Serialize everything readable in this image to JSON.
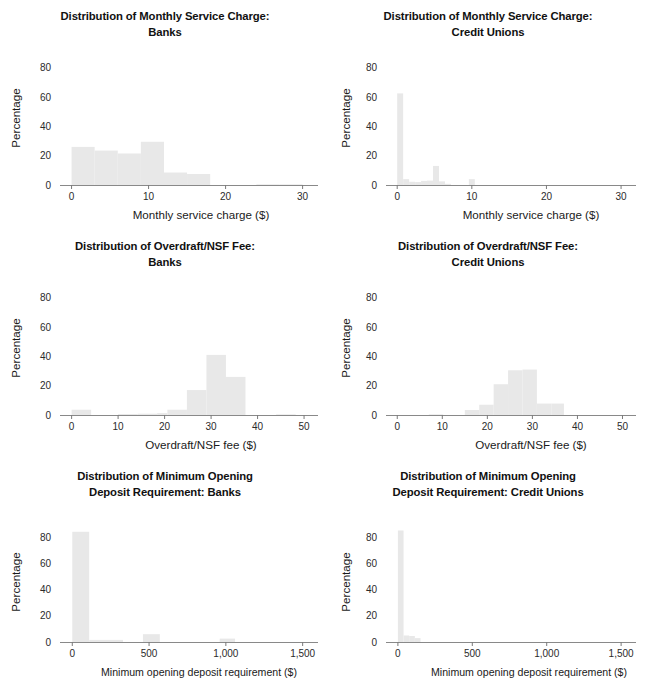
{
  "figure": {
    "kind": "small-multiples-histogram-grid",
    "rows": 3,
    "cols": 2,
    "bar_color": "#e8e8e8",
    "axis_color": "#5a5a5a",
    "text_color": "#1a1a1a"
  },
  "chart_data": [
    {
      "id": "monthly-service-charge-banks",
      "type": "bar",
      "title": "Distribution of Monthly Service Charge: Banks",
      "title_line1": "Distribution of Monthly Service Charge:",
      "title_line2": "Banks",
      "xlabel": "Monthly service charge ($)",
      "ylabel": "Percentage",
      "xlim": [
        -1.5,
        32
      ],
      "ylim": [
        0,
        88
      ],
      "xticks": [
        0,
        10,
        20,
        30
      ],
      "xtick_labels": [
        "0",
        "10",
        "20",
        "30"
      ],
      "yticks": [
        0,
        20,
        40,
        60,
        80
      ],
      "ytick_labels": [
        "0",
        "20",
        "40",
        "60",
        "80"
      ],
      "grid": false,
      "bin_width": 3,
      "bins": [
        {
          "x0": 0,
          "x1": 3,
          "value": 26
        },
        {
          "x0": 3,
          "x1": 6,
          "value": 23.5
        },
        {
          "x0": 6,
          "x1": 9,
          "value": 21.5
        },
        {
          "x0": 9,
          "x1": 12,
          "value": 29.5
        },
        {
          "x0": 12,
          "x1": 15,
          "value": 8.5
        },
        {
          "x0": 15,
          "x1": 18,
          "value": 7.5
        },
        {
          "x0": 24,
          "x1": 27,
          "value": 0.4
        },
        {
          "x0": 27,
          "x1": 30,
          "value": 0.4
        }
      ]
    },
    {
      "id": "monthly-service-charge-credit-unions",
      "type": "bar",
      "title": "Distribution of Monthly Service Charge: Credit Unions",
      "title_line1": "Distribution of Monthly Service Charge:",
      "title_line2": "Credit Unions",
      "xlabel": "Monthly service charge ($)",
      "ylabel": "Percentage",
      "xlim": [
        -1.5,
        32
      ],
      "ylim": [
        0,
        88
      ],
      "xticks": [
        0,
        10,
        20,
        30
      ],
      "xtick_labels": [
        "0",
        "10",
        "20",
        "30"
      ],
      "yticks": [
        0,
        20,
        40,
        60,
        80
      ],
      "ytick_labels": [
        "0",
        "20",
        "40",
        "60",
        "80"
      ],
      "grid": false,
      "bin_width": 0.8,
      "bins": [
        {
          "x0": 0,
          "x1": 0.8,
          "value": 62.5
        },
        {
          "x0": 0.8,
          "x1": 1.6,
          "value": 4.0
        },
        {
          "x0": 1.6,
          "x1": 2.4,
          "value": 2.2
        },
        {
          "x0": 2.4,
          "x1": 3.2,
          "value": 2.0
        },
        {
          "x0": 3.2,
          "x1": 4.0,
          "value": 2.8
        },
        {
          "x0": 4.0,
          "x1": 4.8,
          "value": 3.0
        },
        {
          "x0": 4.8,
          "x1": 5.6,
          "value": 13.0
        },
        {
          "x0": 5.6,
          "x1": 6.4,
          "value": 2.5
        },
        {
          "x0": 6.4,
          "x1": 7.2,
          "value": 0.8
        },
        {
          "x0": 9.6,
          "x1": 10.4,
          "value": 4.0
        }
      ]
    },
    {
      "id": "overdraft-nsf-fee-banks",
      "type": "bar",
      "title": "Distribution of Overdraft/NSF Fee: Banks",
      "title_line1": "Distribution of Overdraft/NSF Fee:",
      "title_line2": "Banks",
      "xlabel": "Overdraft/NSF fee ($)",
      "ylabel": "Percentage",
      "xlim": [
        -2.5,
        53
      ],
      "ylim": [
        0,
        88
      ],
      "xticks": [
        0,
        10,
        20,
        30,
        40,
        50
      ],
      "xtick_labels": [
        "0",
        "10",
        "20",
        "30",
        "40",
        "50"
      ],
      "yticks": [
        0,
        20,
        40,
        60,
        80
      ],
      "ytick_labels": [
        "0",
        "20",
        "40",
        "60",
        "80"
      ],
      "grid": false,
      "bin_width": 4.2,
      "bins": [
        {
          "x0": 0,
          "x1": 4.2,
          "value": 3.6
        },
        {
          "x0": 10.0,
          "x1": 14.2,
          "value": 0.7
        },
        {
          "x0": 14.2,
          "x1": 18.4,
          "value": 0.9
        },
        {
          "x0": 18.4,
          "x1": 20.6,
          "value": 1.3
        },
        {
          "x0": 20.6,
          "x1": 24.8,
          "value": 3.6
        },
        {
          "x0": 24.8,
          "x1": 29.0,
          "value": 17.0
        },
        {
          "x0": 29.0,
          "x1": 33.2,
          "value": 41.0
        },
        {
          "x0": 33.2,
          "x1": 37.4,
          "value": 26.0
        },
        {
          "x0": 44.0,
          "x1": 48.2,
          "value": 0.4
        }
      ]
    },
    {
      "id": "overdraft-nsf-fee-credit-unions",
      "type": "bar",
      "title": "Distribution of Overdraft/NSF Fee: Credit Unions",
      "title_line1": "Distribution of Overdraft/NSF Fee:",
      "title_line2": "Credit Unions",
      "xlabel": "Overdraft/NSF fee ($)",
      "ylabel": "Percentage",
      "xlim": [
        -2.5,
        53
      ],
      "ylim": [
        0,
        88
      ],
      "xticks": [
        0,
        10,
        20,
        30,
        40,
        50
      ],
      "xtick_labels": [
        "0",
        "10",
        "20",
        "30",
        "40",
        "50"
      ],
      "yticks": [
        0,
        20,
        40,
        60,
        80
      ],
      "ytick_labels": [
        "0",
        "20",
        "40",
        "60",
        "80"
      ],
      "grid": false,
      "bin_width": 3.2,
      "bins": [
        {
          "x0": 7.0,
          "x1": 10.2,
          "value": 0.3
        },
        {
          "x0": 15.0,
          "x1": 18.2,
          "value": 3.4
        },
        {
          "x0": 18.2,
          "x1": 21.4,
          "value": 7.0
        },
        {
          "x0": 21.4,
          "x1": 24.6,
          "value": 21.0
        },
        {
          "x0": 24.6,
          "x1": 27.8,
          "value": 30.5
        },
        {
          "x0": 27.8,
          "x1": 31.0,
          "value": 31.0
        },
        {
          "x0": 31.0,
          "x1": 34.2,
          "value": 7.8
        },
        {
          "x0": 34.2,
          "x1": 37.0,
          "value": 7.8
        }
      ]
    },
    {
      "id": "minimum-opening-deposit-banks",
      "type": "bar",
      "title": "Distribution of Minimum Opening Deposit Requirement: Banks",
      "title_line1": "Distribution of Minimum Opening",
      "title_line2": "Deposit Requirement: Banks",
      "xlabel": "Minimum opening deposit requirement ($)",
      "ylabel": "Percentage",
      "xlim": [
        -80,
        1600
      ],
      "ylim": [
        0,
        92
      ],
      "xticks": [
        0,
        500,
        1000,
        1500
      ],
      "xtick_labels": [
        "0",
        "500",
        "1,000",
        "1,500"
      ],
      "yticks": [
        0,
        20,
        40,
        60,
        80
      ],
      "ytick_labels": [
        "0",
        "20",
        "40",
        "60",
        "80"
      ],
      "grid": false,
      "bin_width": 110,
      "bins": [
        {
          "x0": 0,
          "x1": 110,
          "value": 84.5
        },
        {
          "x0": 110,
          "x1": 330,
          "value": 1.6
        },
        {
          "x0": 460,
          "x1": 570,
          "value": 6.0
        },
        {
          "x0": 960,
          "x1": 1060,
          "value": 2.6
        }
      ]
    },
    {
      "id": "minimum-opening-deposit-credit-unions",
      "type": "bar",
      "title": "Distribution of Minimum Opening Deposit Requirement: Credit Unions",
      "title_line1": "Distribution of Minimum Opening",
      "title_line2": "Deposit Requirement: Credit Unions",
      "xlabel": "Minimum opening deposit requirement ($)",
      "ylabel": "Percentage",
      "xlim": [
        -80,
        1600
      ],
      "ylim": [
        0,
        92
      ],
      "xticks": [
        0,
        500,
        1000,
        1500
      ],
      "xtick_labels": [
        "0",
        "500",
        "1,000",
        "1,500"
      ],
      "yticks": [
        0,
        20,
        40,
        60,
        80
      ],
      "ytick_labels": [
        "0",
        "20",
        "40",
        "60",
        "80"
      ],
      "grid": false,
      "bin_width": 38,
      "bins": [
        {
          "x0": 0,
          "x1": 38,
          "value": 85.5
        },
        {
          "x0": 38,
          "x1": 76,
          "value": 5.0
        },
        {
          "x0": 76,
          "x1": 114,
          "value": 4.6
        },
        {
          "x0": 114,
          "x1": 152,
          "value": 3.0
        }
      ]
    }
  ]
}
